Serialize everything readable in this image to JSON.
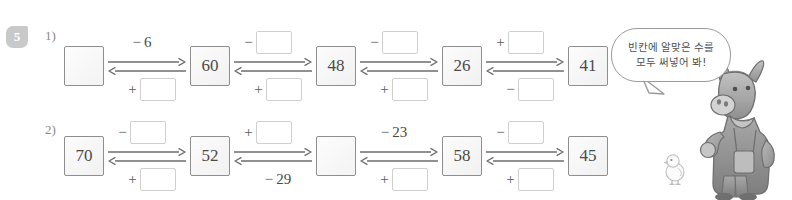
{
  "problem": {
    "badge_number": "5",
    "sub_labels": [
      "1)",
      "2)"
    ]
  },
  "hint": {
    "line1": "빈칸에 알맞은 수를",
    "line2": "모두 써넣어 봐!"
  },
  "colors": {
    "box_border": "#8e8e8e",
    "answer_border": "#cfcfcf",
    "text": "#4a4a4a",
    "badge_bg": "#c9c9c9",
    "arrow": "#6d6d6d"
  },
  "rows": [
    {
      "id": "row-1",
      "label": "1)",
      "boxes": [
        "",
        "60",
        "48",
        "26",
        "41"
      ],
      "links": [
        {
          "top_sign": "−",
          "top_value": "6",
          "top_is_box": false,
          "bottom_sign": "+",
          "bottom_value": "",
          "bottom_is_box": true
        },
        {
          "top_sign": "−",
          "top_value": "",
          "top_is_box": true,
          "bottom_sign": "+",
          "bottom_value": "",
          "bottom_is_box": true
        },
        {
          "top_sign": "−",
          "top_value": "",
          "top_is_box": true,
          "bottom_sign": "+",
          "bottom_value": "",
          "bottom_is_box": true
        },
        {
          "top_sign": "+",
          "top_value": "",
          "top_is_box": true,
          "bottom_sign": "−",
          "bottom_value": "",
          "bottom_is_box": true
        }
      ]
    },
    {
      "id": "row-2",
      "label": "2)",
      "boxes": [
        "70",
        "52",
        "",
        "58",
        "45"
      ],
      "links": [
        {
          "top_sign": "−",
          "top_value": "",
          "top_is_box": true,
          "bottom_sign": "+",
          "bottom_value": "",
          "bottom_is_box": true
        },
        {
          "top_sign": "+",
          "top_value": "",
          "top_is_box": true,
          "bottom_sign": "−",
          "bottom_value": "29",
          "bottom_is_box": false
        },
        {
          "top_sign": "−",
          "top_value": "23",
          "top_is_box": false,
          "bottom_sign": "+",
          "bottom_value": "",
          "bottom_is_box": true
        },
        {
          "top_sign": "−",
          "top_value": "",
          "top_is_box": true,
          "bottom_sign": "+",
          "bottom_value": "",
          "bottom_is_box": true
        }
      ]
    }
  ]
}
